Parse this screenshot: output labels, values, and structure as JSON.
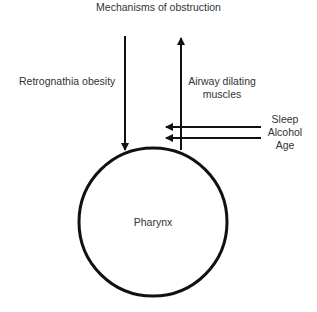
{
  "diagram": {
    "title": "Mechanisms of obstruction",
    "left_factor": "Retrognathia obesity",
    "right_factor_line1": "Airway dilating",
    "right_factor_line2": "muscles",
    "inhibitors": [
      "Sleep",
      "Alcohol",
      "Age"
    ],
    "center_label": "Pharynx",
    "colors": {
      "stroke": "#111111",
      "text": "#333333",
      "background": "#ffffff"
    }
  }
}
